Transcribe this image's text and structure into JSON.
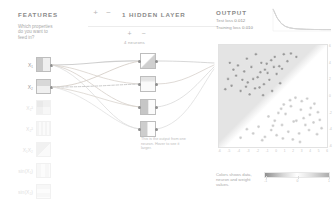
{
  "features": {
    "heading": "FEATURES",
    "description": "Which properties do you want to feed in?",
    "items": [
      {
        "label": "X₁",
        "active": true,
        "name": "feature-x1"
      },
      {
        "label": "X₂",
        "active": true,
        "name": "feature-x2"
      },
      {
        "label": "X₁²",
        "active": false,
        "name": "feature-x1-squared"
      },
      {
        "label": "X₂²",
        "active": false,
        "name": "feature-x2-squared"
      },
      {
        "label": "X₁X₂",
        "active": false,
        "name": "feature-x1x2"
      },
      {
        "label": "sin(X₁)",
        "active": false,
        "name": "feature-sin-x1"
      },
      {
        "label": "sin(X₂)",
        "active": false,
        "name": "feature-sin-x2"
      }
    ]
  },
  "network": {
    "layer_heading": "1 HIDDEN LAYER",
    "layer_count": "1",
    "add_layer_label": "+",
    "remove_layer_label": "−",
    "add_neuron_label": "+",
    "remove_neuron_label": "−",
    "neuron_count_label": "4 neurons",
    "neuron_note": "This is the output from one neuron. Hover to see it larger.",
    "neuron_note_emphasis": "neuron"
  },
  "output": {
    "heading": "OUTPUT",
    "test_loss_label": "Test loss",
    "test_loss_value": "0.012",
    "training_loss_label": "Training loss",
    "training_loss_value": "0.010",
    "legend_text": "Colors shows data, neuron and weight values.",
    "legend_ticks": [
      "-1",
      "0",
      "1"
    ],
    "x_ticks": [
      "-6",
      "-5",
      "-4",
      "-3",
      "-2",
      "-1",
      "0",
      "1",
      "2",
      "3",
      "4",
      "5",
      "6"
    ],
    "y_ticks": [
      "6",
      "4",
      "2",
      "0",
      "-2",
      "-4",
      "-6"
    ]
  },
  "chart_data": {
    "type": "scatter",
    "xlabel": "",
    "ylabel": "",
    "xlim": [
      -6,
      6
    ],
    "ylim": [
      -6,
      6
    ],
    "grid": false,
    "legend": "bottom",
    "series": [
      {
        "name": "class-positive",
        "color": "#8c8c8c",
        "points": [
          [
            -4.6,
            1.2
          ],
          [
            -4.1,
            2.4
          ],
          [
            -3.6,
            0.6
          ],
          [
            -3.2,
            2.9
          ],
          [
            -2.8,
            1.6
          ],
          [
            -2.4,
            3.4
          ],
          [
            -2.0,
            0.9
          ],
          [
            -1.7,
            2.2
          ],
          [
            -1.3,
            3.9
          ],
          [
            -1.0,
            1.4
          ],
          [
            -0.6,
            2.7
          ],
          [
            -0.2,
            4.2
          ],
          [
            -3.9,
            3.6
          ],
          [
            -2.9,
            4.4
          ],
          [
            -1.9,
            4.9
          ],
          [
            -0.9,
            3.1
          ],
          [
            0.2,
            4.6
          ],
          [
            0.7,
            3.5
          ],
          [
            1.2,
            4.9
          ],
          [
            -5.0,
            2.0
          ],
          [
            -4.4,
            3.1
          ],
          [
            -3.4,
            1.9
          ],
          [
            -2.2,
            2.0
          ],
          [
            -1.5,
            1.0
          ],
          [
            -0.4,
            1.9
          ],
          [
            0.4,
            2.6
          ],
          [
            1.0,
            3.2
          ],
          [
            1.6,
            4.1
          ],
          [
            -0.1,
            0.6
          ],
          [
            0.8,
            1.5
          ],
          [
            -2.6,
            0.2
          ],
          [
            -1.1,
            0.1
          ],
          [
            0.1,
            3.4
          ],
          [
            -3.0,
            1.1
          ],
          [
            -1.4,
            2.8
          ],
          [
            -0.7,
            3.8
          ],
          [
            2.0,
            5.0
          ],
          [
            2.6,
            4.6
          ],
          [
            -5.3,
            0.8
          ],
          [
            -4.8,
            3.9
          ]
        ]
      },
      {
        "name": "class-negative",
        "color": "#c4c4c4",
        "points": [
          [
            1.4,
            -2.1
          ],
          [
            2.0,
            -1.2
          ],
          [
            2.6,
            -2.9
          ],
          [
            3.1,
            -1.6
          ],
          [
            3.6,
            -3.4
          ],
          [
            4.1,
            -2.2
          ],
          [
            4.6,
            -0.9
          ],
          [
            1.0,
            -3.4
          ],
          [
            1.7,
            -4.2
          ],
          [
            2.3,
            -3.0
          ],
          [
            2.9,
            -4.4
          ],
          [
            3.4,
            -2.6
          ],
          [
            4.0,
            -4.0
          ],
          [
            4.5,
            -3.1
          ],
          [
            5.0,
            -1.9
          ],
          [
            0.4,
            -4.6
          ],
          [
            -0.2,
            -4.0
          ],
          [
            -0.9,
            -4.8
          ],
          [
            0.9,
            -1.5
          ],
          [
            1.9,
            -0.5
          ],
          [
            2.5,
            -0.2
          ],
          [
            3.2,
            -0.6
          ],
          [
            4.2,
            -1.4
          ],
          [
            5.2,
            -2.8
          ],
          [
            -1.6,
            -3.6
          ],
          [
            -2.2,
            -4.4
          ],
          [
            -2.9,
            -3.9
          ],
          [
            0.2,
            -2.9
          ],
          [
            0.6,
            -2.0
          ],
          [
            1.2,
            -1.0
          ],
          [
            3.8,
            -0.3
          ],
          [
            4.9,
            -4.5
          ],
          [
            2.2,
            -5.1
          ],
          [
            1.1,
            -5.0
          ],
          [
            -0.5,
            -2.4
          ],
          [
            5.4,
            -3.8
          ],
          [
            -1.2,
            -5.2
          ],
          [
            3.0,
            -5.4
          ],
          [
            0.0,
            -3.5
          ],
          [
            -3.6,
            -4.9
          ]
        ]
      }
    ],
    "loss_curve": {
      "name": "loss-over-epochs",
      "values": [
        0.52,
        0.3,
        0.16,
        0.09,
        0.055,
        0.038,
        0.028,
        0.022,
        0.018,
        0.015,
        0.013,
        0.012,
        0.011,
        0.01,
        0.01
      ]
    }
  },
  "colors": {
    "positive": "#8c8c8c",
    "negative": "#c4c4c4",
    "accent": "#8a8a8a"
  }
}
